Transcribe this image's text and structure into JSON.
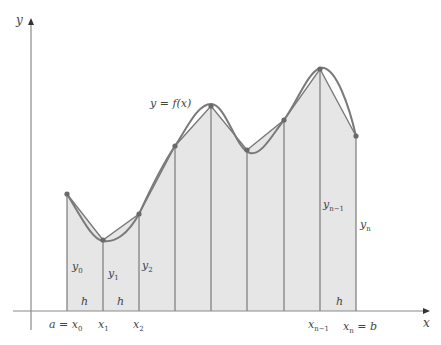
{
  "figure": {
    "curve_label": "y = f(x)",
    "axes": {
      "x_label": "x",
      "y_label": "y"
    },
    "colors": {
      "fill": "#e6e6e6",
      "curve": "#7a7a7a",
      "lines": "#6e6e6e",
      "axis": "#8a8a8a",
      "point": "#6a6a6a"
    },
    "points": [
      {
        "x": 67,
        "y": 194
      },
      {
        "x": 103,
        "y": 240
      },
      {
        "x": 139,
        "y": 214
      },
      {
        "x": 175,
        "y": 146
      },
      {
        "x": 211,
        "y": 106
      },
      {
        "x": 247,
        "y": 150
      },
      {
        "x": 284,
        "y": 120
      },
      {
        "x": 320,
        "y": 69
      },
      {
        "x": 356,
        "y": 136
      }
    ],
    "ordinate_labels": [
      {
        "main": "y",
        "sub": "0"
      },
      {
        "main": "y",
        "sub": "1"
      },
      {
        "main": "y",
        "sub": "2"
      },
      {
        "main": "y",
        "sub": "n−1"
      },
      {
        "main": "y",
        "sub": "n"
      }
    ],
    "width_label": "h",
    "x_tick_labels": [
      {
        "prefix": "a = ",
        "main": "x",
        "sub": "0"
      },
      {
        "prefix": "",
        "main": "x",
        "sub": "1"
      },
      {
        "prefix": "",
        "main": "x",
        "sub": "2"
      },
      {
        "prefix": "",
        "main": "x",
        "sub": "n−1"
      },
      {
        "prefix": "",
        "main": "x",
        "sub": "n",
        "suffix": " = b"
      }
    ]
  }
}
